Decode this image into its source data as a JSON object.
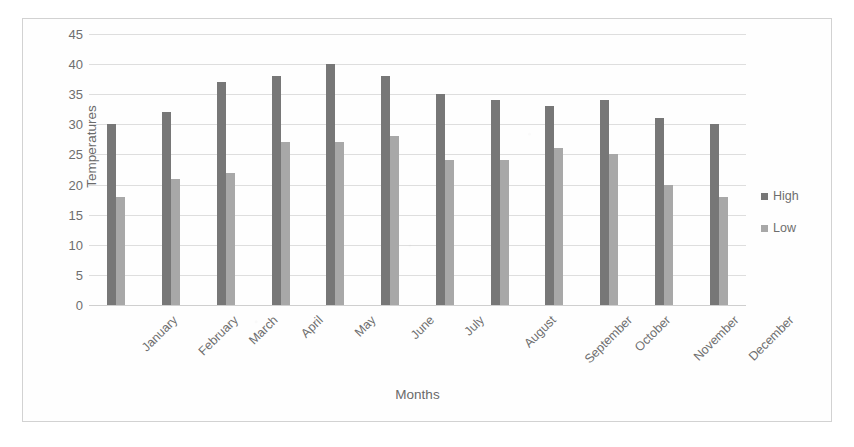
{
  "chart_data": {
    "type": "bar",
    "title": "",
    "xlabel": "Months",
    "ylabel": "Temperatures",
    "categories": [
      "January",
      "February",
      "March",
      "April",
      "May",
      "June",
      "July",
      "August",
      "September",
      "October",
      "November",
      "December"
    ],
    "series": [
      {
        "name": "High",
        "color": "#777777",
        "values": [
          30,
          32,
          37,
          38,
          40,
          38,
          35,
          34,
          33,
          34,
          31,
          30
        ]
      },
      {
        "name": "Low",
        "color": "#a8a8a8",
        "values": [
          18,
          21,
          22,
          27,
          27,
          28,
          24,
          24,
          26,
          25,
          20,
          18
        ]
      }
    ],
    "ylim": [
      0,
      45
    ],
    "ytick_values": [
      0,
      5,
      10,
      15,
      20,
      25,
      30,
      35,
      40,
      45
    ],
    "ytick_labels": [
      "0",
      "5",
      "10",
      "15",
      "20",
      "25",
      "30",
      "35",
      "40",
      "45"
    ],
    "grid": true,
    "legend_position": "right",
    "x_tick_rotation": -45
  },
  "legend": {
    "items": [
      {
        "label": "High",
        "marker": "square-marker"
      },
      {
        "label": "Low",
        "marker": "square-marker"
      }
    ]
  }
}
